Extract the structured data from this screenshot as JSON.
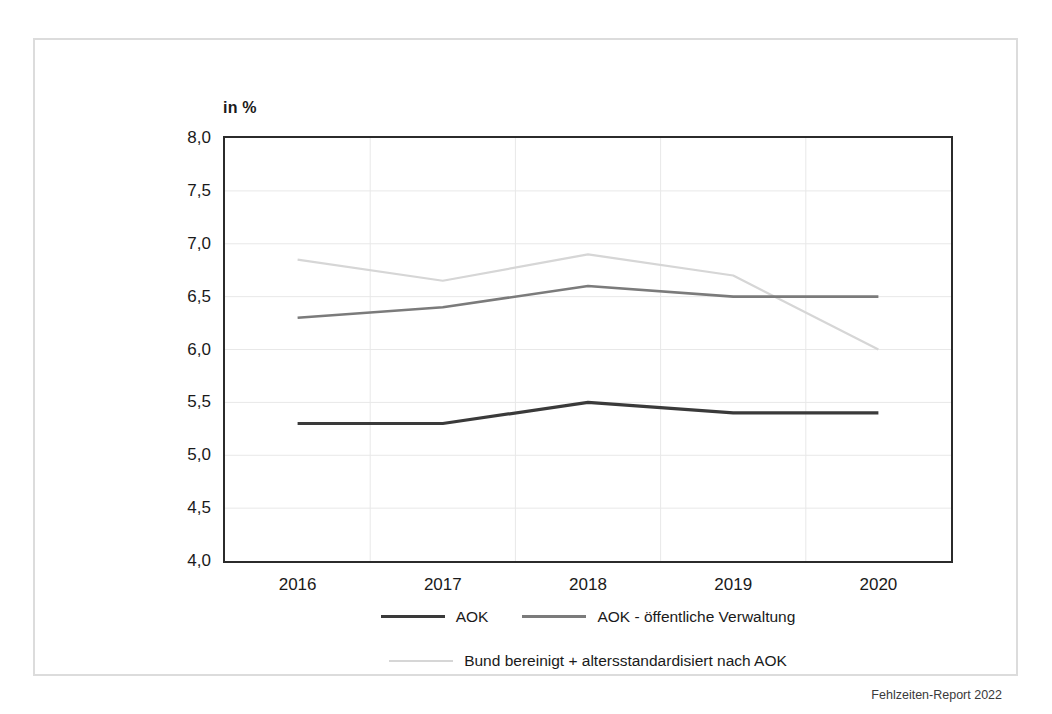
{
  "figure": {
    "unit_label": "in %",
    "source_note": "Fehlzeiten-Report 2022"
  },
  "colors": {
    "series_aok": "#3a3a3a",
    "series_verwaltung": "#7b7b7b",
    "series_bund": "#d6d6d6",
    "axis": "#2b2b2b",
    "gridline": "#e8e8e8",
    "frame": "#dcdcdc",
    "text": "#1a1a1a"
  },
  "chart_data": {
    "type": "line",
    "title": "",
    "subtitle": "",
    "xlabel": "",
    "ylabel": "in %",
    "categories": [
      "2016",
      "2017",
      "2018",
      "2019",
      "2020"
    ],
    "x": [
      2016,
      2017,
      2018,
      2019,
      2020
    ],
    "ylim": [
      4.0,
      8.0
    ],
    "ytick_step": 0.5,
    "ytick_labels": [
      "8,0",
      "7,5",
      "7,0",
      "6,5",
      "6,0",
      "5,5",
      "5,0",
      "4,5",
      "4,0"
    ],
    "ytick_values": [
      8.0,
      7.5,
      7.0,
      6.5,
      6.0,
      5.5,
      5.0,
      4.5,
      4.0
    ],
    "xtick_labels": [
      "2016",
      "2017",
      "2018",
      "2019",
      "2020"
    ],
    "grid": true,
    "legend_position": "bottom",
    "series": [
      {
        "name": "AOK",
        "color": "#3a3a3a",
        "width": 3.2,
        "values": [
          5.3,
          5.3,
          5.5,
          5.4,
          5.4
        ]
      },
      {
        "name": "AOK - öffentliche Verwaltung",
        "color": "#7b7b7b",
        "width": 2.6,
        "values": [
          6.3,
          6.4,
          6.6,
          6.5,
          6.5
        ]
      },
      {
        "name": "Bund bereinigt + altersstandardisiert nach AOK",
        "color": "#d6d6d6",
        "width": 2.2,
        "values": [
          6.85,
          6.65,
          6.9,
          6.7,
          6.0
        ]
      }
    ]
  }
}
